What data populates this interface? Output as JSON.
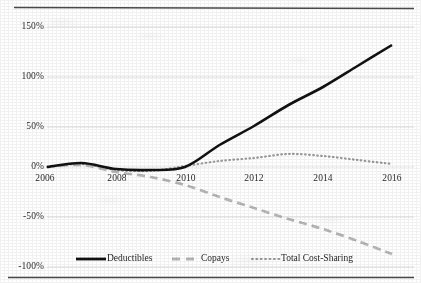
{
  "chart_data": {
    "type": "line",
    "title": "",
    "subtitle": "",
    "xlabel": "",
    "ylabel": "",
    "xlim": [
      2006,
      2016
    ],
    "ylim": [
      -100,
      150
    ],
    "grid": true,
    "grid_axis": "y",
    "legend_position": "bottom",
    "x_tick_labels": [
      "2006",
      "2008",
      "2010",
      "2012",
      "2014",
      "2016"
    ],
    "x_tick_values": [
      2006,
      2008,
      2010,
      2012,
      2014,
      2016
    ],
    "y_tick_labels": [
      "150%",
      "100%",
      "50%",
      "0%",
      "-50%",
      "-100%"
    ],
    "y_tick_values": [
      150,
      100,
      50,
      0,
      -50,
      -100
    ],
    "x": [
      2006,
      2007,
      2008,
      2009,
      2010,
      2011,
      2012,
      2013,
      2014,
      2015,
      2016
    ],
    "series": [
      {
        "name": "Deductibles",
        "style": "solid",
        "color": "#111111",
        "width": 2.6,
        "values": [
          0,
          4,
          -2,
          -3,
          0,
          22,
          41,
          62,
          80,
          101,
          122
        ]
      },
      {
        "name": "Copays",
        "style": "dashed",
        "color": "#b6b6b6",
        "width": 2.6,
        "values": [
          0,
          2,
          -5,
          -10,
          -18,
          -30,
          -41,
          -52,
          -62,
          -74,
          -87
        ]
      },
      {
        "name": "Total Cost-Sharing",
        "style": "dotted",
        "color": "#9a9a9a",
        "width": 2.2,
        "values": [
          0,
          3,
          -3,
          -4,
          1,
          6,
          9,
          13,
          11,
          7,
          3
        ]
      }
    ]
  },
  "legend": {
    "items": [
      {
        "label": "Deductibles",
        "marker": "solid-line-swatch"
      },
      {
        "label": "Copays",
        "marker": "dashed-line-swatch"
      },
      {
        "label": "Total Cost-Sharing",
        "marker": "dotted-line-swatch"
      }
    ]
  },
  "colors": {
    "axis_border": "#3a3a3a",
    "gridline": "#d8d8d8",
    "deductibles": "#111111",
    "copays": "#b6b6b6",
    "total_cost_sharing": "#9a9a9a",
    "text": "#2b2b2b",
    "background": "#ffffff"
  }
}
